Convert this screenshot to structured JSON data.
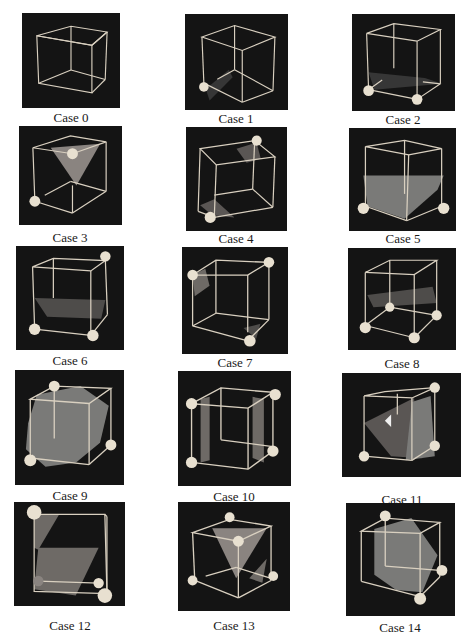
{
  "figure": {
    "cases": [
      {
        "label": "Case 0",
        "x": 22,
        "y": 13,
        "w": 98,
        "h": 95,
        "cap_x": 11,
        "cap_y": 111
      },
      {
        "label": "Case 1",
        "x": 185,
        "y": 14,
        "w": 103,
        "h": 96,
        "cap_x": 176,
        "cap_y": 112
      },
      {
        "label": "Case 2",
        "x": 352,
        "y": 14,
        "w": 103,
        "h": 97,
        "cap_x": 343,
        "cap_y": 113
      },
      {
        "label": "Case 3",
        "x": 19,
        "y": 126,
        "w": 103,
        "h": 99,
        "cap_x": 10,
        "cap_y": 231
      },
      {
        "label": "Case 4",
        "x": 186,
        "y": 127,
        "w": 101,
        "h": 104,
        "cap_x": 176,
        "cap_y": 232
      },
      {
        "label": "Case 5",
        "x": 349,
        "y": 128,
        "w": 107,
        "h": 103,
        "cap_x": 343,
        "cap_y": 232
      },
      {
        "label": "Case 6",
        "x": 16,
        "y": 246,
        "w": 108,
        "h": 104,
        "cap_x": 10,
        "cap_y": 354
      },
      {
        "label": "Case 7",
        "x": 182,
        "y": 247,
        "w": 106,
        "h": 107,
        "cap_x": 175,
        "cap_y": 356
      },
      {
        "label": "Case 8",
        "x": 348,
        "y": 248,
        "w": 108,
        "h": 102,
        "cap_x": 342,
        "cap_y": 357
      },
      {
        "label": "Case 9",
        "x": 15,
        "y": 370,
        "w": 109,
        "h": 115,
        "cap_x": 10,
        "cap_y": 489
      },
      {
        "label": "Case 10",
        "x": 178,
        "y": 371,
        "w": 113,
        "h": 115,
        "cap_x": 174,
        "cap_y": 490
      },
      {
        "label": "Case 11",
        "x": 342,
        "y": 373,
        "w": 119,
        "h": 104,
        "cap_x": 342,
        "cap_y": 493
      },
      {
        "label": "Case 12",
        "x": 14,
        "y": 502,
        "w": 111,
        "h": 104,
        "cap_x": 10,
        "cap_y": 619
      },
      {
        "label": "Case 13",
        "x": 178,
        "y": 502,
        "w": 112,
        "h": 109,
        "cap_x": 174,
        "cap_y": 619
      },
      {
        "label": "Case 14",
        "x": 346,
        "y": 503,
        "w": 109,
        "h": 113,
        "cap_x": 340,
        "cap_y": 621
      }
    ]
  },
  "colors": {
    "panel_bg": "#141414",
    "edge": "#d9d0c0",
    "sphere": "#e8e0d0",
    "surface": "#7a7a78",
    "caption": "#1a1a1a"
  }
}
